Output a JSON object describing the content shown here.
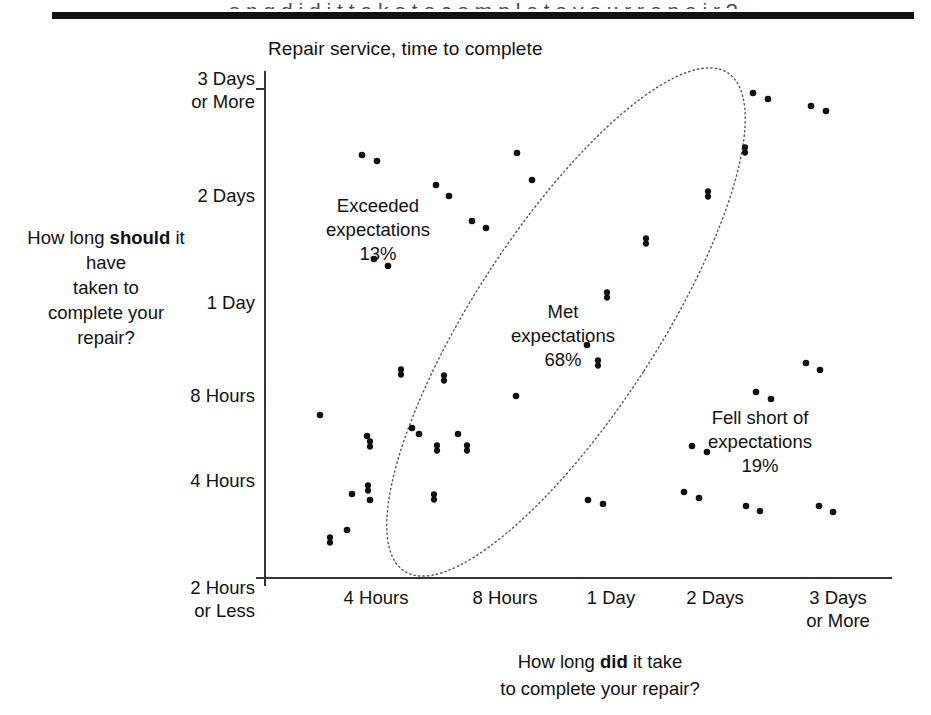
{
  "page": {
    "top_cut_text": "o n g  d i d  i t  t a k e  t o  c o m p l e t e  y o u r  r e p a i r ?"
  },
  "chart_data": {
    "type": "scatter",
    "title": "Repair service, time to complete",
    "xlabel": "How long did it take to complete your repair?",
    "xlabel_parts": [
      "How long ",
      "did",
      " it take",
      "to complete your repair?"
    ],
    "ylabel": "How long should it have taken to complete your repair?",
    "ylabel_parts": [
      "How long ",
      "should",
      " it have",
      "taken to",
      "complete your",
      "repair?"
    ],
    "grid": false,
    "legend": "none",
    "x_ticks": [
      "4 Hours",
      "8 Hours",
      "1 Day",
      "2 Days",
      "3 Days\nor More"
    ],
    "y_ticks": [
      "3 Days\nor More",
      "2 Days",
      "1 Day",
      "8 Hours",
      "4 Hours",
      "2 Hours\nor Less"
    ],
    "x_axis_range": [
      "2 Hours or Less",
      "3 Days or More"
    ],
    "y_axis_range": [
      "2 Hours or Less",
      "3 Days or More"
    ],
    "annotations": [
      {
        "name": "exceeded",
        "label": "Exceeded\nexpectations\n13%",
        "text": "Exceeded expectations",
        "percent": "13%",
        "x": 378,
        "y": 207
      },
      {
        "name": "met",
        "label": "Met\nexpectations\n68%",
        "text": "Met expectations",
        "percent": "68%",
        "x": 563,
        "y": 312
      },
      {
        "name": "fell-short",
        "label": "Fell short of\nexpectations\n19%",
        "text": "Fell short of expectations",
        "percent": "19%",
        "x": 760,
        "y": 418
      }
    ],
    "ellipse": {
      "cx": 566,
      "cy": 322,
      "rx": 92,
      "ry": 297,
      "rotation": 33,
      "style": "dotted",
      "encloses": "Met expectations"
    },
    "points": [
      {
        "x": 362,
        "y": 155,
        "d": 2
      },
      {
        "x": 377,
        "y": 161,
        "d": 2
      },
      {
        "x": 436,
        "y": 185,
        "d": 2
      },
      {
        "x": 449,
        "y": 196,
        "d": 2
      },
      {
        "x": 472,
        "y": 221,
        "d": 2
      },
      {
        "x": 486,
        "y": 228,
        "d": 2
      },
      {
        "x": 374,
        "y": 259,
        "d": 2
      },
      {
        "x": 388,
        "y": 266,
        "d": 2
      },
      {
        "x": 517,
        "y": 153,
        "d": 2
      },
      {
        "x": 532,
        "y": 180,
        "d": 2
      },
      {
        "x": 753,
        "y": 93,
        "d": 2
      },
      {
        "x": 768,
        "y": 99,
        "d": 2
      },
      {
        "x": 811,
        "y": 106,
        "d": 2
      },
      {
        "x": 826,
        "y": 111,
        "d": 2
      },
      {
        "x": 745,
        "y": 150,
        "d": 6
      },
      {
        "x": 708,
        "y": 194,
        "d": 6
      },
      {
        "x": 646,
        "y": 241,
        "d": 6
      },
      {
        "x": 607,
        "y": 295,
        "d": 6
      },
      {
        "x": 598,
        "y": 363,
        "d": 6
      },
      {
        "x": 587,
        "y": 345,
        "d": 2
      },
      {
        "x": 401,
        "y": 372,
        "d": 6
      },
      {
        "x": 444,
        "y": 378,
        "d": 6
      },
      {
        "x": 516,
        "y": 396,
        "d": 2
      },
      {
        "x": 320,
        "y": 415,
        "d": 2
      },
      {
        "x": 412,
        "y": 428,
        "d": 2
      },
      {
        "x": 419,
        "y": 434,
        "d": 2
      },
      {
        "x": 367,
        "y": 436,
        "d": 2
      },
      {
        "x": 458,
        "y": 434,
        "d": 2
      },
      {
        "x": 370,
        "y": 444,
        "d": 6
      },
      {
        "x": 437,
        "y": 448,
        "d": 6
      },
      {
        "x": 467,
        "y": 448,
        "d": 6
      },
      {
        "x": 368,
        "y": 488,
        "d": 6
      },
      {
        "x": 352,
        "y": 494,
        "d": 2
      },
      {
        "x": 370,
        "y": 500,
        "d": 2
      },
      {
        "x": 434,
        "y": 497,
        "d": 6
      },
      {
        "x": 347,
        "y": 530,
        "d": 2
      },
      {
        "x": 330,
        "y": 540,
        "d": 6
      },
      {
        "x": 588,
        "y": 500,
        "d": 2
      },
      {
        "x": 603,
        "y": 504,
        "d": 2
      },
      {
        "x": 692,
        "y": 446,
        "d": 2
      },
      {
        "x": 707,
        "y": 452,
        "d": 2
      },
      {
        "x": 684,
        "y": 492,
        "d": 2
      },
      {
        "x": 699,
        "y": 498,
        "d": 2
      },
      {
        "x": 746,
        "y": 506,
        "d": 2
      },
      {
        "x": 760,
        "y": 511,
        "d": 2
      },
      {
        "x": 756,
        "y": 392,
        "d": 2
      },
      {
        "x": 771,
        "y": 399,
        "d": 2
      },
      {
        "x": 806,
        "y": 363,
        "d": 2
      },
      {
        "x": 820,
        "y": 370,
        "d": 2
      },
      {
        "x": 819,
        "y": 506,
        "d": 2
      },
      {
        "x": 833,
        "y": 512,
        "d": 2
      }
    ],
    "axis_geometry": {
      "x_tick_px": [
        376,
        505,
        611,
        715,
        838
      ],
      "y_tick_px": [
        88,
        205,
        312,
        405,
        490,
        577
      ],
      "plot_left": 264,
      "plot_right": 892,
      "plot_top": 71,
      "plot_bottom": 578
    }
  }
}
